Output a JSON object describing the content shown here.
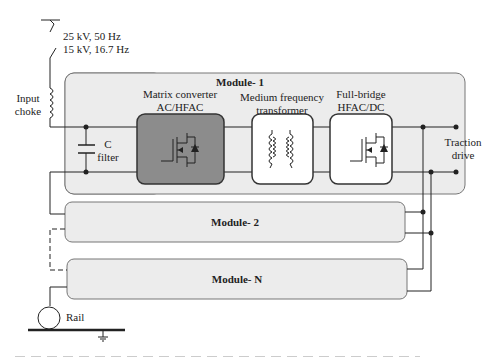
{
  "source": {
    "line1": "25 kV, 50 Hz",
    "line2": "15 kV, 16.7 Hz"
  },
  "input_choke": {
    "line1": "Input",
    "line2": "choke"
  },
  "c_filter": {
    "line1": "C",
    "line2": "filter"
  },
  "modules": [
    {
      "title": "Module- 1"
    },
    {
      "title": "Module- 2"
    },
    {
      "title": "Module- N"
    }
  ],
  "blocks": {
    "matrix": {
      "line1": "Matrix converter",
      "line2": "AC/HFAC"
    },
    "transformer": {
      "line1": "Medium frequency",
      "line2": "transformer"
    },
    "fullbridge": {
      "line1": "Full-bridge",
      "line2": "HFAC/DC"
    }
  },
  "traction": {
    "line1": "Traction",
    "line2": "drive"
  },
  "rail": {
    "label": "Rail"
  },
  "colors": {
    "module_fill": "#ececec",
    "matrix_fill": "#8c8c8c",
    "block_fill": "#ffffff",
    "line": "#222222"
  }
}
